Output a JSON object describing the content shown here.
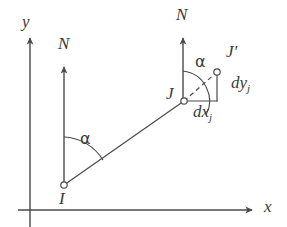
{
  "figure": {
    "type": "geometry-diagram",
    "background_color": "#ffffff",
    "stroke_color": "#4a4a4a",
    "text_color": "#3a3a3a"
  },
  "axes": {
    "x_label": "x",
    "y_label": "y",
    "x_axis": {
      "x1": 18,
      "y1": 210,
      "x2": 256,
      "y2": 210
    },
    "y_axis": {
      "x1": 30,
      "y1": 227,
      "x2": 30,
      "y2": 33
    },
    "x_label_pos": {
      "left": 264,
      "top": 199
    },
    "y_label_pos": {
      "left": 22,
      "top": 14
    }
  },
  "north_arrows": [
    {
      "label": "N",
      "at_point": "I",
      "line": {
        "x1": 64,
        "y1": 185,
        "x2": 64,
        "y2": 62
      },
      "label_pos": {
        "left": 58,
        "top": 36
      }
    },
    {
      "label": "N",
      "at_point": "J",
      "line": {
        "x1": 183,
        "y1": 101,
        "x2": 183,
        "y2": 33
      },
      "label_pos": {
        "left": 177,
        "top": 7
      }
    }
  ],
  "points": [
    {
      "id": "I",
      "label": "I",
      "cx": 64,
      "cy": 185,
      "r": 3.2,
      "label_pos": {
        "left": 58,
        "top": 190
      }
    },
    {
      "id": "J",
      "label": "J",
      "cx": 184,
      "cy": 101,
      "r": 3.2,
      "label_pos": {
        "left": 166,
        "top": 85
      }
    },
    {
      "id": "Jp",
      "label": "J'",
      "cx": 217,
      "cy": 72,
      "r": 3.2,
      "label_pos": {
        "left": 226,
        "top": 44
      }
    }
  ],
  "lines": {
    "main_line": {
      "from": "I",
      "to": "J",
      "style": "solid",
      "x1": 64,
      "y1": 185,
      "x2": 184,
      "y2": 101
    },
    "extension_line": {
      "from": "J",
      "to": "Jp",
      "style": "dashed",
      "x1": 184,
      "y1": 101,
      "x2": 217,
      "y2": 72
    },
    "dx_leg": {
      "style": "solid",
      "x1": 184,
      "y1": 101,
      "x2": 217,
      "y2": 101
    },
    "dy_leg": {
      "style": "solid",
      "x1": 217,
      "y1": 101,
      "x2": 217,
      "y2": 72
    }
  },
  "angles": [
    {
      "symbol": "α",
      "vertex": "I",
      "label_pos": {
        "left": 80,
        "top": 132
      },
      "arc": {
        "cx": 64,
        "cy": 185,
        "r": 48,
        "start_deg": 90,
        "end_deg": 35
      }
    },
    {
      "symbol": "α",
      "vertex": "J",
      "label_pos": {
        "left": 195,
        "top": 55
      },
      "arc": {
        "cx": 184,
        "cy": 101,
        "r": 30,
        "start_deg": 90,
        "end_deg": 41
      }
    }
  ],
  "increments": [
    {
      "id": "dx",
      "text": "dx",
      "subscript": "j",
      "label_pos": {
        "left": 193,
        "top": 103
      }
    },
    {
      "id": "dy",
      "text": "dy",
      "subscript": "j",
      "label_pos": {
        "left": 231,
        "top": 74
      }
    }
  ]
}
